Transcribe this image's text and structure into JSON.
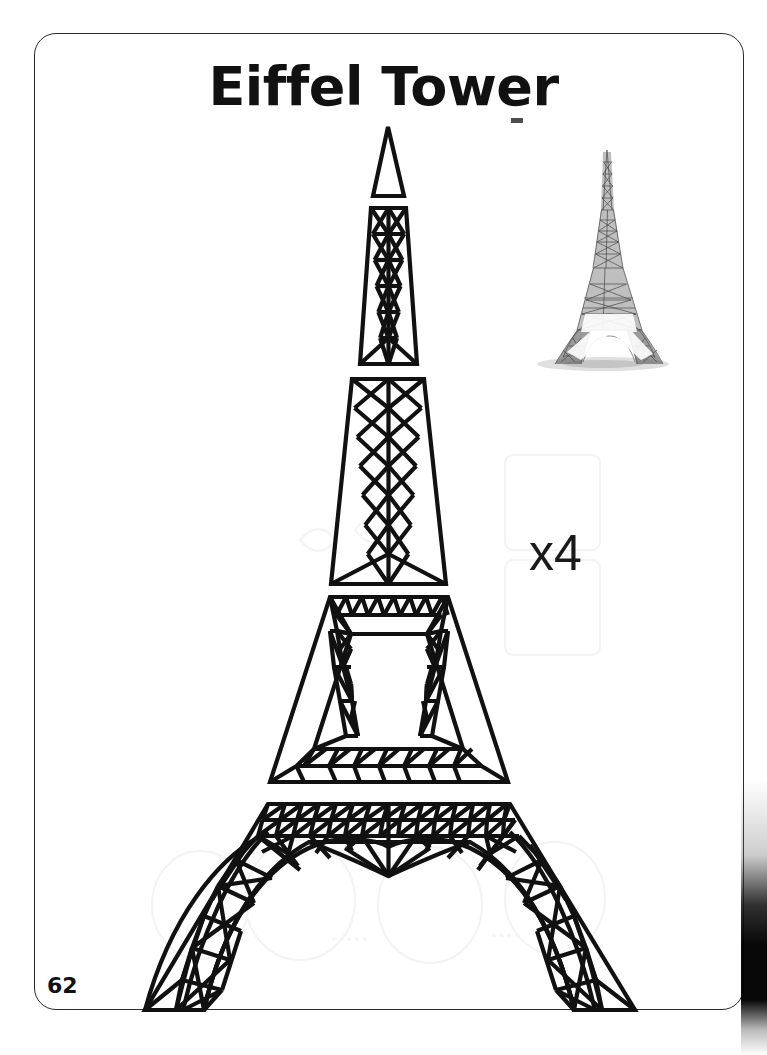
{
  "page": {
    "title": "Eiffel Tower",
    "page_number": "62",
    "quantity_label": "x4",
    "background_color": "#ffffff",
    "ink_color": "#111111",
    "border_color": "#2b2b2b"
  },
  "photo": {
    "name": "completed-eiffel-tower-model-photo",
    "description": "Photograph of finished matchstick Eiffel Tower model",
    "tone_color": "#4a4a4a",
    "shadow_color": "#c9c9c9"
  },
  "pattern": {
    "name": "eiffel-tower-cut-pattern",
    "stroke_color": "#111111",
    "pieces": [
      {
        "id": "spire",
        "label": "Spire",
        "order": 1
      },
      {
        "id": "upper-tower",
        "label": "Upper tower section",
        "order": 2
      },
      {
        "id": "mid-tower",
        "label": "Middle tower section",
        "order": 3
      },
      {
        "id": "second-platform",
        "label": "Second platform ring",
        "order": 4
      },
      {
        "id": "base-arch",
        "label": "Base arch with legs",
        "order": 5
      }
    ]
  }
}
